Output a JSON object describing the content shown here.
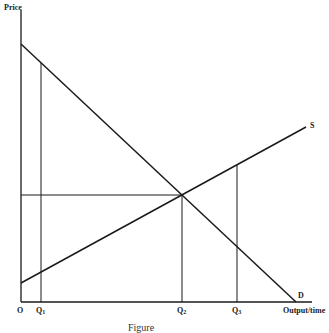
{
  "diagram": {
    "type": "supply-demand",
    "y_axis_label": "Price",
    "x_axis_label": "Output/time",
    "origin_label": "O",
    "curves": [
      {
        "name": "S",
        "label": "S",
        "from": [
          21,
          283
        ],
        "to": [
          306,
          127
        ]
      },
      {
        "name": "D",
        "label": "D",
        "from": [
          21,
          44
        ],
        "to": [
          296,
          302
        ]
      }
    ],
    "quantities": [
      {
        "label": "Q",
        "sub": "1",
        "x": 41
      },
      {
        "label": "Q",
        "sub": "2",
        "x": 182
      },
      {
        "label": "Q",
        "sub": "3",
        "x": 237
      }
    ],
    "equilibrium": {
      "x": 182,
      "y": 195
    },
    "caption": "Figure"
  },
  "colors": {
    "line": "#1a1a1a",
    "background": "#ffffff"
  }
}
